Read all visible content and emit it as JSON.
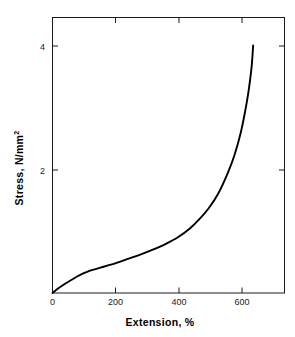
{
  "chart_data": {
    "type": "line",
    "title": "",
    "xlabel": "Extension, %",
    "ylabel": "Stress, N/mm",
    "ylabel_superscript": "2",
    "xlim": [
      0,
      740
    ],
    "ylim": [
      0,
      4.45
    ],
    "grid": false,
    "legend": null,
    "xticks": [
      0,
      200,
      400,
      600
    ],
    "xtick_labels": [
      "0",
      "200",
      "400",
      "600"
    ],
    "yticks": [
      2,
      4
    ],
    "ytick_labels": [
      "2",
      "4"
    ],
    "series": [
      {
        "name": "stress-extension",
        "color": "#000000",
        "x": [
          0,
          20,
          40,
          60,
          80,
          100,
          120,
          140,
          160,
          180,
          200,
          240,
          280,
          320,
          360,
          400,
          440,
          470,
          500,
          530,
          560,
          580,
          600,
          615,
          625,
          635,
          640
        ],
        "y": [
          0.0,
          0.08,
          0.15,
          0.21,
          0.27,
          0.32,
          0.36,
          0.39,
          0.42,
          0.45,
          0.48,
          0.55,
          0.62,
          0.7,
          0.79,
          0.9,
          1.05,
          1.2,
          1.38,
          1.62,
          1.95,
          2.22,
          2.58,
          2.95,
          3.25,
          3.65,
          4.0
        ]
      }
    ]
  },
  "colors": {
    "background": "#ffffff",
    "axis": "#1a1a1a",
    "curve": "#000000",
    "text": "#000000"
  }
}
